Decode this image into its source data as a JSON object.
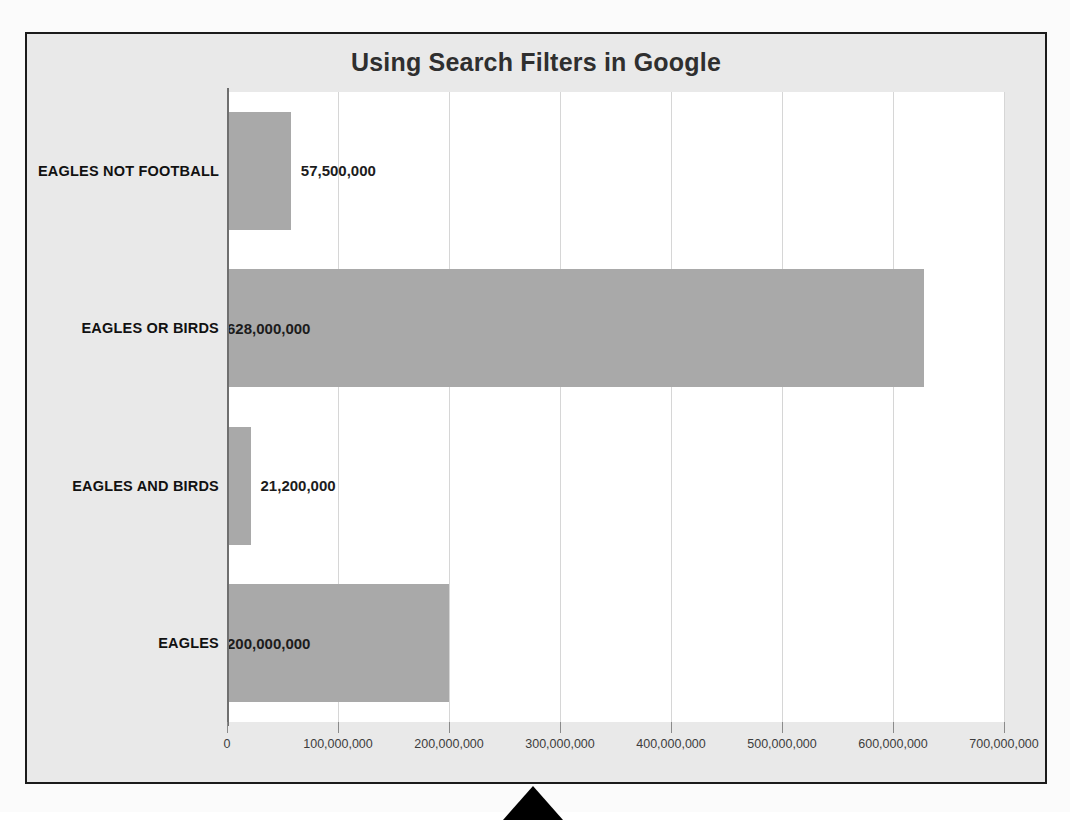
{
  "chart_data": {
    "type": "bar",
    "orientation": "horizontal",
    "title": "Using Search Filters in Google",
    "xlabel": "",
    "ylabel": "",
    "categories": [
      "EAGLES NOT FOOTBALL",
      "EAGLES OR BIRDS",
      "EAGLES AND BIRDS",
      "EAGLES"
    ],
    "values": [
      57500000,
      21200000,
      628000000,
      200000000
    ],
    "value_labels": [
      "57,500,000",
      "628,000,000",
      "21,200,000",
      "200,000,000"
    ],
    "bars": [
      {
        "category": "EAGLES NOT FOOTBALL",
        "value": 57500000,
        "label": "57,500,000",
        "label_position": "outside-end"
      },
      {
        "category": "EAGLES OR BIRDS",
        "value": 628000000,
        "label": "628,000,000",
        "label_position": "inside-end"
      },
      {
        "category": "EAGLES AND BIRDS",
        "value": 21200000,
        "label": "21,200,000",
        "label_position": "outside-end"
      },
      {
        "category": "EAGLES",
        "value": 200000000,
        "label": "200,000,000",
        "label_position": "inside-end"
      }
    ],
    "xlim": [
      0,
      700000000
    ],
    "xticks": [
      0,
      100000000,
      200000000,
      300000000,
      400000000,
      500000000,
      600000000,
      700000000
    ],
    "xtick_labels": [
      "0",
      "100,000,000",
      "200,000,000",
      "300,000,000",
      "400,000,000",
      "500,000,000",
      "600,000,000",
      "700,000,000"
    ],
    "grid": true,
    "grid_axis": "x",
    "legend": false,
    "colors": {
      "bar": "#a9a9a9",
      "chart_background": "#e9e9e9",
      "plot_background": "#ffffff",
      "gridline": "#d6d6d6",
      "axis_line": "#6f6f6f",
      "title_text": "#2f2f2f",
      "label_text": "#111111",
      "tick_text": "#3d3d3d",
      "frame_border": "#1b1b1b",
      "pointer": "#000000"
    }
  },
  "overlay": {
    "pointer_name": "up-arrow-pointer"
  }
}
